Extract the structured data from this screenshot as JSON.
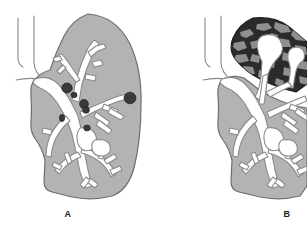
{
  "figure": {
    "background_color": "#ffffff",
    "width": 307,
    "height": 240,
    "type": "medical-illustration"
  },
  "colors": {
    "background": "#ffffff",
    "lung_parenchyma": "#b3b3b3",
    "lung_outline": "#6e6e6e",
    "bronchial_tree_fill": "#ffffff",
    "bronchial_tree_outline": "#8a8a8a",
    "nodule_fill": "#3a3a3a",
    "nodule_outline": "#1f1f1f",
    "consolidation_dark": "#2b2b2b",
    "consolidation_mottle": "#8f8f8f",
    "trachea_outline": "#8a8a8a",
    "label_text": "#1a1a1a"
  },
  "panels": [
    {
      "id": "panel-a",
      "label": "A",
      "label_x": 58,
      "label_y": 209,
      "description": "Lung with multiple discrete dark nodules distributed along the bronchial tree",
      "lesion_type": "nodules",
      "nodule_count": 6,
      "nodules": [
        {
          "cx": 67,
          "cy": 88,
          "rx": 5.2,
          "ry": 5.0
        },
        {
          "cx": 74,
          "cy": 95,
          "rx": 3.0,
          "ry": 2.8
        },
        {
          "cx": 84,
          "cy": 104,
          "rx": 4.4,
          "ry": 4.6
        },
        {
          "cx": 86,
          "cy": 110,
          "rx": 3.4,
          "ry": 3.2
        },
        {
          "cx": 62,
          "cy": 118,
          "rx": 2.6,
          "ry": 3.4
        },
        {
          "cx": 87,
          "cy": 128,
          "rx": 3.2,
          "ry": 3.0
        },
        {
          "cx": 130,
          "cy": 98,
          "rx": 6.0,
          "ry": 5.8
        }
      ]
    },
    {
      "id": "panel-b",
      "label": "B",
      "label_x": 277,
      "label_y": 209,
      "description": "Lung with dark mottled cavitating consolidation occupying the upper lobe",
      "lesion_type": "consolidation-with-cavitation",
      "consolidation_region": "upper-lobe",
      "cavity_count": 2
    }
  ],
  "labels": {
    "panel_a": "A",
    "panel_b": "B"
  }
}
